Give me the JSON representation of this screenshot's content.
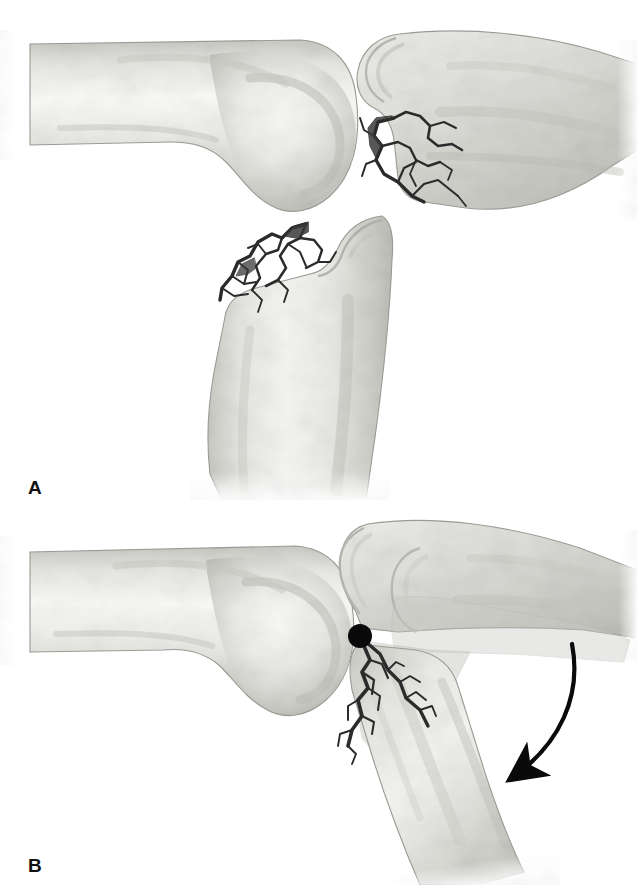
{
  "figure": {
    "background_color": "#ffffff",
    "width": 637,
    "height": 885,
    "panels": [
      {
        "id": "A",
        "label": "A",
        "caption_text": "A",
        "description": "Displaced transverse olecranon fracture of the elbow shown in lateral view. The distal humerus lies to the left, the separated proximal olecranon fragment is displaced proximally and posteriorly to the upper right, and the distal ulna with the coronoid process lies below. Both fracture surfaces show jagged interdigitating cancellous bone.",
        "structures": [
          {
            "name": "distal-humerus",
            "label": "Distal humerus",
            "position": "left"
          },
          {
            "name": "olecranon-fragment",
            "label": "Proximal olecranon fragment",
            "position": "upper-right"
          },
          {
            "name": "distal-ulna",
            "label": "Distal ulna with coronoid process",
            "position": "lower-center"
          }
        ]
      },
      {
        "id": "B",
        "label": "B",
        "caption_text": "B",
        "description": "Mechanism of displacement. The distal humerus is at left. A solid black dot marks the fulcrum / pivot point at the fracture site. A ghosted translucent overlay shows the original anatomic position of the proximal ulna, and a curved arrow shows the direction the ulna shaft rotates and angulates away from the humerus.",
        "structures": [
          {
            "name": "distal-humerus",
            "label": "Distal humerus",
            "position": "left"
          },
          {
            "name": "olecranon-fragment",
            "label": "Olecranon fragment",
            "position": "upper-right"
          },
          {
            "name": "ulna-shaft-displaced",
            "label": "Displaced ulna shaft",
            "position": "lower-right"
          },
          {
            "name": "ghost-overlay",
            "label": "Translucent original position overlay",
            "position": "center-right"
          }
        ],
        "annotations": [
          {
            "name": "pivot-dot",
            "type": "filled-circle",
            "label": "Fulcrum / pivot point",
            "color": "#0a0a0a",
            "x": 360,
            "y": 636,
            "radius": 12
          },
          {
            "name": "rotation-arrow",
            "type": "curved-arrow",
            "label": "Direction of rotation",
            "color": "#0a0a0a",
            "start": [
              572,
              644
            ],
            "end": [
              492,
              784
            ]
          }
        ]
      }
    ]
  },
  "palette": {
    "background": "#ffffff",
    "bone_light": "#f4f4f2",
    "bone_mid": "#d8d8d4",
    "bone_shadow": "#b5b5b0",
    "bone_outline": "#9a9a95",
    "cortex_edge": "#a8a8a3",
    "fracture_line": "#2b2b2b",
    "annotation_black": "#0a0a0a",
    "ghost_overlay": "#c9c9c4",
    "label_text": "#111111"
  }
}
